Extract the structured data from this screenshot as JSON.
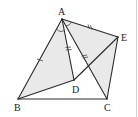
{
  "figure": {
    "type": "geometry-diagram",
    "points": {
      "A": {
        "label": "A",
        "x": 62,
        "y": 19
      },
      "B": {
        "label": "B",
        "x": 18,
        "y": 99
      },
      "C": {
        "label": "C",
        "x": 107,
        "y": 99
      },
      "D": {
        "label": "D",
        "x": 74,
        "y": 80
      },
      "E": {
        "label": "E",
        "x": 118,
        "y": 37
      }
    },
    "segments": [
      "AB",
      "AC",
      "AD",
      "AE",
      "BC",
      "BD",
      "DE",
      "EC"
    ],
    "shaded_regions": [
      "ABD",
      "AEC"
    ],
    "equal_marks": {
      "single": [
        "AB",
        "AD"
      ],
      "double": [
        "AE",
        "AC"
      ]
    },
    "angle_mark": "BAD/CAE at A",
    "colors": {
      "line": "#2a2a2a",
      "shade": "#e9e9e9",
      "background": "#ffffff"
    }
  }
}
